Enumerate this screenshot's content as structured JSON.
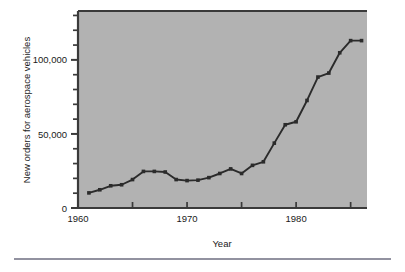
{
  "figure": {
    "background_color": "#ffffff",
    "plot_background_color": "#b2b2b2",
    "frame_color": "#3a3a3a",
    "line_color": "#2b2b2b",
    "rule_color": "#6e6e80"
  },
  "chart_data": {
    "type": "line",
    "title": "",
    "xlabel": "Year",
    "ylabel": "New orders for aerospace vehicles",
    "xlim": [
      1960,
      1986.5
    ],
    "ylim": [
      0,
      133000
    ],
    "grid": false,
    "legend": "none",
    "x_ticks_major": [
      1960,
      1970,
      1980
    ],
    "x_tick_labels": [
      "1960",
      "1970",
      "1980"
    ],
    "x_ticks_minor": [
      1965,
      1975,
      1985
    ],
    "y_ticks_major": [
      0,
      50000,
      100000
    ],
    "y_tick_labels": [
      "0",
      "50,000",
      "100,000"
    ],
    "y_ticks_minor": [
      10000,
      20000,
      30000,
      40000,
      60000,
      70000,
      80000,
      90000,
      110000,
      120000,
      130000
    ],
    "markers": "filled-square",
    "x": [
      1961,
      1962,
      1963,
      1964,
      1965,
      1966,
      1967,
      1968,
      1969,
      1970,
      1971,
      1972,
      1973,
      1974,
      1975,
      1976,
      1977,
      1978,
      1979,
      1980,
      1981,
      1982,
      1983,
      1984,
      1985,
      1986
    ],
    "values": [
      10200,
      12300,
      15000,
      15700,
      19200,
      24700,
      24700,
      24300,
      19200,
      18500,
      18800,
      20500,
      23300,
      26400,
      23300,
      28800,
      31200,
      43800,
      56200,
      58200,
      72600,
      88400,
      91100,
      104800,
      113000,
      113000
    ]
  }
}
